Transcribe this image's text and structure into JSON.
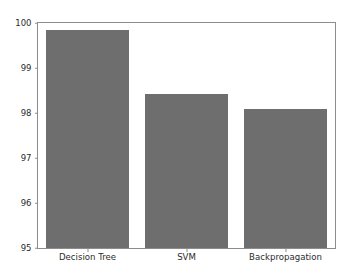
{
  "figure": {
    "background_color": "#ffffff",
    "plot_background_color": "#ffffff",
    "spine_color": "#8d8d8d",
    "tick_label_color": "#2b2b2b"
  },
  "chart_data": {
    "type": "bar",
    "title": "",
    "subtitle": "",
    "xlabel": "",
    "ylabel": "",
    "categories": [
      "Decision Tree",
      "SVM",
      "Backpropagation"
    ],
    "values": [
      99.85,
      98.43,
      98.08
    ],
    "series": [
      {
        "name": "Accuracy",
        "values": [
          99.85,
          98.43,
          98.08
        ],
        "color": "#6e6e6e"
      }
    ],
    "ylim": [
      95,
      100
    ],
    "xlim": [
      0,
      3
    ],
    "yticks": [
      95,
      96,
      97,
      98,
      99,
      100
    ],
    "ytick_labels": [
      "95",
      "96",
      "97",
      "98",
      "99",
      "100"
    ],
    "xtick_labels": [
      "Decision Tree",
      "SVM",
      "Backpropagation"
    ],
    "grid": false,
    "legend": null,
    "legend_position": "none",
    "annotations": [],
    "bar_color": "#6e6e6e",
    "bar_width_fraction": 0.83
  }
}
